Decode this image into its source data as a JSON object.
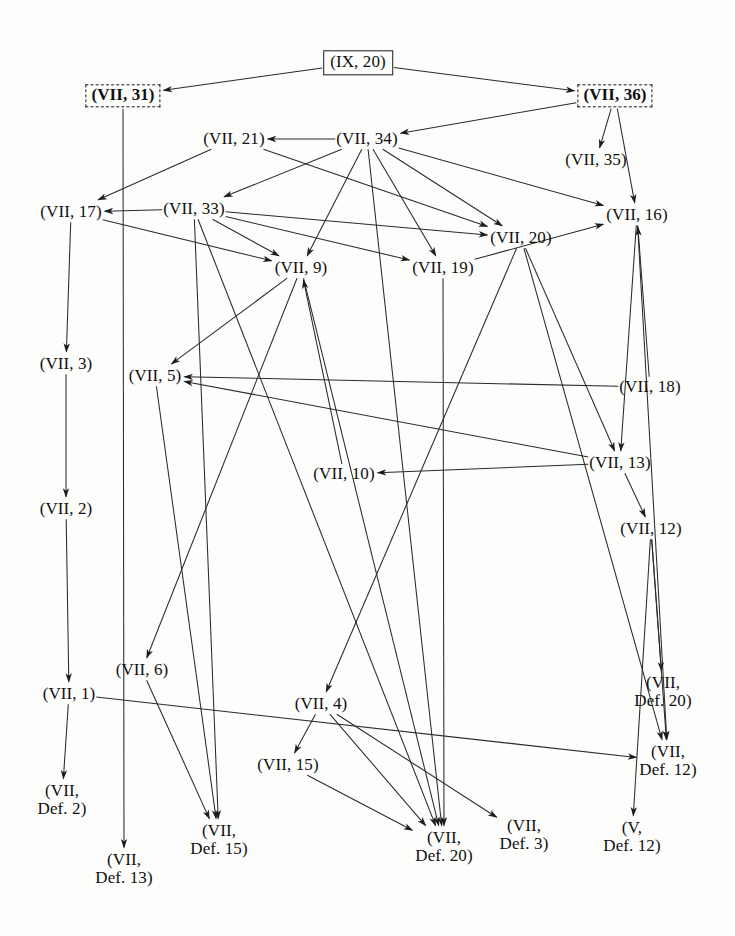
{
  "diagram": {
    "type": "directed-acyclic-graph",
    "width": 735,
    "height": 936,
    "background": "#fdfdfc",
    "edge_color": "#2a2a2a",
    "text_color": "#101010"
  },
  "nodes": [
    {
      "id": "IX20",
      "label": "(IX, 20)",
      "x": 358,
      "y": 63,
      "style": "boxed",
      "bold": false,
      "lines": [
        "(IX, 20)"
      ]
    },
    {
      "id": "VII31",
      "label": "(VII, 31)",
      "x": 123,
      "y": 96,
      "style": "dashed",
      "bold": true,
      "lines": [
        "(VII, 31)"
      ]
    },
    {
      "id": "VII36",
      "label": "(VII, 36)",
      "x": 615,
      "y": 96,
      "style": "dashed",
      "bold": true,
      "lines": [
        "(VII, 36)"
      ]
    },
    {
      "id": "VII21",
      "label": "(VII, 21)",
      "x": 234,
      "y": 139,
      "style": "plain",
      "bold": false,
      "lines": [
        "(VII, 21)"
      ]
    },
    {
      "id": "VII34",
      "label": "(VII, 34)",
      "x": 367,
      "y": 139,
      "style": "plain",
      "bold": false,
      "lines": [
        "(VII, 34)"
      ]
    },
    {
      "id": "VII35",
      "label": "(VII, 35)",
      "x": 596,
      "y": 160,
      "style": "plain",
      "bold": false,
      "lines": [
        "(VII, 35)"
      ]
    },
    {
      "id": "VII17",
      "label": "(VII, 17)",
      "x": 71,
      "y": 212,
      "style": "plain",
      "bold": false,
      "lines": [
        "(VII, 17)"
      ]
    },
    {
      "id": "VII33",
      "label": "(VII, 33)",
      "x": 194,
      "y": 209,
      "style": "plain",
      "bold": false,
      "lines": [
        "(VII, 33)"
      ]
    },
    {
      "id": "VII20",
      "label": "(VII, 20)",
      "x": 521,
      "y": 238,
      "style": "plain",
      "bold": false,
      "lines": [
        "(VII, 20)"
      ]
    },
    {
      "id": "VII16",
      "label": "(VII, 16)",
      "x": 637,
      "y": 215,
      "style": "plain",
      "bold": false,
      "lines": [
        "(VII, 16)"
      ]
    },
    {
      "id": "VII9",
      "label": "(VII, 9)",
      "x": 301,
      "y": 268,
      "style": "plain",
      "bold": false,
      "lines": [
        "(VII, 9)"
      ]
    },
    {
      "id": "VII19",
      "label": "(VII, 19)",
      "x": 443,
      "y": 268,
      "style": "plain",
      "bold": false,
      "lines": [
        "(VII, 19)"
      ]
    },
    {
      "id": "VII3",
      "label": "(VII, 3)",
      "x": 66,
      "y": 364,
      "style": "plain",
      "bold": false,
      "lines": [
        "(VII, 3)"
      ]
    },
    {
      "id": "VII5",
      "label": "(VII, 5)",
      "x": 155,
      "y": 376,
      "style": "plain",
      "bold": false,
      "lines": [
        "(VII, 5)"
      ]
    },
    {
      "id": "VII18",
      "label": "(VII, 18)",
      "x": 650,
      "y": 387,
      "style": "plain",
      "bold": false,
      "lines": [
        "(VII, 18)"
      ]
    },
    {
      "id": "VII10",
      "label": "(VII, 10)",
      "x": 344,
      "y": 474,
      "style": "plain",
      "bold": false,
      "lines": [
        "(VII, 10)"
      ]
    },
    {
      "id": "VII13",
      "label": "(VII, 13)",
      "x": 620,
      "y": 463,
      "style": "plain",
      "bold": false,
      "lines": [
        "(VII, 13)"
      ]
    },
    {
      "id": "VII2",
      "label": "(VII, 2)",
      "x": 66,
      "y": 509,
      "style": "plain",
      "bold": false,
      "lines": [
        "(VII, 2)"
      ]
    },
    {
      "id": "VII12",
      "label": "(VII, 12)",
      "x": 651,
      "y": 529,
      "style": "plain",
      "bold": false,
      "lines": [
        "(VII, 12)"
      ]
    },
    {
      "id": "VII6",
      "label": "(VII, 6)",
      "x": 142,
      "y": 670,
      "style": "plain",
      "bold": false,
      "lines": [
        "(VII, 6)"
      ]
    },
    {
      "id": "VII1",
      "label": "(VII, 1)",
      "x": 69,
      "y": 694,
      "style": "plain",
      "bold": false,
      "lines": [
        "(VII, 1)"
      ]
    },
    {
      "id": "VII4",
      "label": "(VII, 4)",
      "x": 321,
      "y": 704,
      "style": "plain",
      "bold": false,
      "lines": [
        "(VII, 4)"
      ]
    },
    {
      "id": "VIIDef20b",
      "label": "(VII, Def. 20)",
      "x": 663,
      "y": 692,
      "style": "plain",
      "bold": false,
      "lines": [
        "(VII,",
        "Def. 20)"
      ]
    },
    {
      "id": "VIIDef12",
      "label": "(VII, Def. 12)",
      "x": 668,
      "y": 761,
      "style": "plain",
      "bold": false,
      "lines": [
        "(VII,",
        "Def. 12)"
      ]
    },
    {
      "id": "VII15",
      "label": "(VII, 15)",
      "x": 288,
      "y": 765,
      "style": "plain",
      "bold": false,
      "lines": [
        "(VII, 15)"
      ]
    },
    {
      "id": "VIIDef2",
      "label": "(VII, Def. 2)",
      "x": 62,
      "y": 800,
      "style": "plain",
      "bold": false,
      "lines": [
        "(VII,",
        "Def. 2)"
      ]
    },
    {
      "id": "VIIDef15",
      "label": "(VII, Def. 15)",
      "x": 219,
      "y": 840,
      "style": "plain",
      "bold": false,
      "lines": [
        "(VII,",
        "Def. 15)"
      ]
    },
    {
      "id": "VIIDef20",
      "label": "(VII, Def. 20)",
      "x": 444,
      "y": 847,
      "style": "plain",
      "bold": false,
      "lines": [
        "(VII,",
        "Def. 20)"
      ]
    },
    {
      "id": "VIIDef3",
      "label": "(VII, Def. 3)",
      "x": 524,
      "y": 835,
      "style": "plain",
      "bold": false,
      "lines": [
        "(VII,",
        "Def. 3)"
      ]
    },
    {
      "id": "VDef12",
      "label": "(V, Def. 12)",
      "x": 632,
      "y": 837,
      "style": "plain",
      "bold": false,
      "lines": [
        "(V,",
        "Def. 12)"
      ]
    },
    {
      "id": "VIIDef13",
      "label": "(VII, Def. 13)",
      "x": 124,
      "y": 869,
      "style": "plain",
      "bold": false,
      "lines": [
        "(VII,",
        "Def. 13)"
      ]
    }
  ],
  "edges": [
    {
      "from": "IX20",
      "to": "VII31"
    },
    {
      "from": "IX20",
      "to": "VII36"
    },
    {
      "from": "VII31",
      "to": "VIIDef13"
    },
    {
      "from": "VII36",
      "to": "VII35"
    },
    {
      "from": "VII36",
      "to": "VII34"
    },
    {
      "from": "VII36",
      "to": "VII16"
    },
    {
      "from": "VII34",
      "to": "VII21"
    },
    {
      "from": "VII34",
      "to": "VII33"
    },
    {
      "from": "VII34",
      "to": "VII20"
    },
    {
      "from": "VII34",
      "to": "VII19"
    },
    {
      "from": "VII34",
      "to": "VII16"
    },
    {
      "from": "VII34",
      "to": "VIIDef20"
    },
    {
      "from": "VII34",
      "to": "VII9"
    },
    {
      "from": "VII21",
      "to": "VII17"
    },
    {
      "from": "VII21",
      "to": "VII20"
    },
    {
      "from": "VII33",
      "to": "VII17"
    },
    {
      "from": "VII33",
      "to": "VII20"
    },
    {
      "from": "VII33",
      "to": "VII19"
    },
    {
      "from": "VII33",
      "to": "VII9"
    },
    {
      "from": "VII33",
      "to": "VIIDef15"
    },
    {
      "from": "VII33",
      "to": "VIIDef20"
    },
    {
      "from": "VII20",
      "to": "VII13"
    },
    {
      "from": "VII20",
      "to": "VIIDef12"
    },
    {
      "from": "VII20",
      "to": "VII4"
    },
    {
      "from": "VII19",
      "to": "VII16"
    },
    {
      "from": "VII19",
      "to": "VIIDef20"
    },
    {
      "from": "VII16",
      "to": "VII13"
    },
    {
      "from": "VII16",
      "to": "VIIDef12"
    },
    {
      "from": "VII17",
      "to": "VII3"
    },
    {
      "from": "VII17",
      "to": "VII9"
    },
    {
      "from": "VII9",
      "to": "VII5"
    },
    {
      "from": "VII9",
      "to": "VII6"
    },
    {
      "from": "VII9",
      "to": "VIIDef20"
    },
    {
      "from": "VII3",
      "to": "VII2"
    },
    {
      "from": "VII5",
      "to": "VIIDef15"
    },
    {
      "from": "VII18",
      "to": "VII5"
    },
    {
      "from": "VII18",
      "to": "VII16"
    },
    {
      "from": "VII13",
      "to": "VII10"
    },
    {
      "from": "VII13",
      "to": "VII5"
    },
    {
      "from": "VII13",
      "to": "VII12"
    },
    {
      "from": "VII12",
      "to": "VIIDef20b"
    },
    {
      "from": "VII12",
      "to": "VIIDef12"
    },
    {
      "from": "VII12",
      "to": "VDef12"
    },
    {
      "from": "VII10",
      "to": "VII9"
    },
    {
      "from": "VII2",
      "to": "VII1"
    },
    {
      "from": "VII1",
      "to": "VIIDef2"
    },
    {
      "from": "VII1",
      "to": "VIIDef12"
    },
    {
      "from": "VII6",
      "to": "VIIDef15"
    },
    {
      "from": "VII4",
      "to": "VII15"
    },
    {
      "from": "VII4",
      "to": "VIIDef20"
    },
    {
      "from": "VII4",
      "to": "VIIDef3"
    },
    {
      "from": "VII15",
      "to": "VIIDef20"
    }
  ]
}
